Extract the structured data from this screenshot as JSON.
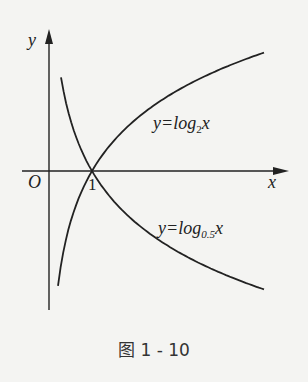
{
  "chart_data": {
    "type": "line",
    "title": "",
    "caption": "图 1 - 10",
    "xlabel": "x",
    "ylabel": "y",
    "origin_label": "O",
    "tick_labels": [
      "1"
    ],
    "grid": false,
    "legend": "inline labels",
    "series": [
      {
        "name": "y=log2x",
        "label_prefix": "y=log",
        "label_base": "2",
        "label_var": "x",
        "base": 2,
        "x": [
          0.21,
          0.5,
          1,
          2,
          3,
          4,
          5
        ],
        "y": [
          -2.25,
          -1,
          0,
          1,
          1.58,
          2,
          2.32
        ]
      },
      {
        "name": "y=log0.5x",
        "label_prefix": "y=log",
        "label_base": "0.5",
        "label_var": "x",
        "base": 0.5,
        "x": [
          0.28,
          0.5,
          1,
          2,
          3,
          4,
          5
        ],
        "y": [
          1.84,
          1,
          0,
          -1,
          -1.58,
          -2,
          -2.32
        ]
      }
    ],
    "intersection": {
      "x": 1,
      "y": 0
    },
    "xlim": [
      -0.6,
      5.5
    ],
    "ylim": [
      -2.7,
      2.8
    ]
  }
}
